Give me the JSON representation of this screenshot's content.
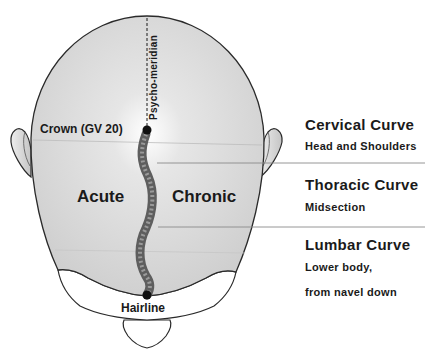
{
  "diagram": {
    "meridian_label": "Psycho-meridian",
    "points": {
      "crown": "Crown (GV 20)",
      "hairline": "Hairline"
    },
    "sides": {
      "left": "Acute",
      "right": "Chronic"
    },
    "curves": [
      {
        "title": "Cervical Curve",
        "desc_lines": [
          "Head and Shoulders"
        ]
      },
      {
        "title": "Thoracic Curve",
        "desc_lines": [
          "Midsection"
        ]
      },
      {
        "title": "Lumbar Curve",
        "desc_lines": [
          "Lower body,",
          "from navel down"
        ]
      }
    ],
    "colors": {
      "skin": "#d6d6d6",
      "outline": "#2a2a2a",
      "text": "#1a1a1a",
      "divider": "#9a9a9a",
      "spine": "#6e6e6e"
    }
  }
}
